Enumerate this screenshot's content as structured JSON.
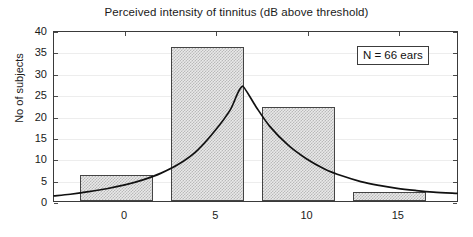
{
  "chart_data": {
    "type": "bar",
    "title": "Perceived intensity of tinnitus (dB above threshold)",
    "xlabel": "",
    "ylabel": "No of subjects",
    "xlim": [
      -3.9,
      18.3
    ],
    "ylim": [
      0,
      40
    ],
    "yticks": [
      0,
      5,
      10,
      15,
      20,
      25,
      30,
      35,
      40
    ],
    "xticks": [
      0,
      5,
      10,
      15
    ],
    "grid": true,
    "legend": false,
    "bars": [
      {
        "x_start": -2.5,
        "x_end": 1.5,
        "value": 6
      },
      {
        "x_start": 2.5,
        "x_end": 6.5,
        "value": 36
      },
      {
        "x_start": 7.5,
        "x_end": 11.5,
        "value": 22
      },
      {
        "x_start": 12.5,
        "x_end": 16.5,
        "value": 2
      }
    ],
    "categories": [
      "-2.5 to 1.5",
      "2.5 to 6.5",
      "7.5 to 11.5",
      "12.5 to 16.5"
    ],
    "values": [
      6,
      36,
      22,
      2
    ],
    "series": [
      {
        "name": "fitted distribution",
        "type": "line",
        "x": [
          -3.9,
          -3.0,
          -2.0,
          -1.0,
          0.0,
          1.0,
          2.0,
          3.0,
          4.0,
          5.0,
          5.8,
          6.5,
          7.2,
          8.0,
          9.0,
          10.0,
          11.0,
          12.0,
          13.0,
          14.0,
          15.0,
          16.0,
          17.0,
          18.3
        ],
        "y": [
          1.2,
          1.6,
          2.2,
          2.9,
          3.8,
          5.0,
          6.6,
          8.8,
          12.0,
          16.8,
          21.5,
          27.2,
          22.5,
          17.6,
          13.2,
          10.0,
          7.6,
          5.9,
          4.6,
          3.7,
          3.0,
          2.5,
          2.1,
          1.8
        ]
      }
    ],
    "annotations": [
      {
        "name": "sample-size",
        "text": "N = 66 ears",
        "x": 13.2,
        "y": 34.5
      }
    ]
  },
  "ytick_labels": [
    "0",
    "5",
    "10",
    "15",
    "20",
    "25",
    "30",
    "35",
    "40"
  ],
  "xtick_labels": [
    "0",
    "5",
    "10",
    "15"
  ],
  "annotation": {
    "text": "N = 66 ears"
  },
  "colors": {
    "axis": "#3a3a3a",
    "grid": "#ededed",
    "bar_fill": "#e9e9e9",
    "bar_edge": "#444444",
    "curve": "#111111",
    "text": "#1a1a1a",
    "background": "#ffffff"
  }
}
